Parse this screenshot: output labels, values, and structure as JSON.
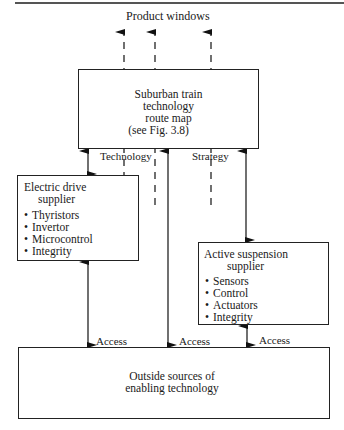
{
  "title_top": "Product windows",
  "route_map": {
    "lines": [
      "Suburban train",
      "technology",
      "route map",
      "(see Fig. 3.8)"
    ]
  },
  "flow_labels": {
    "technology": "Technology",
    "strategy": "Strategy",
    "access_left": "Access",
    "access_middle": "Access",
    "access_right": "Access"
  },
  "electric_drive": {
    "title_lines": [
      "Electric drive",
      "supplier"
    ],
    "items": [
      "Thyristors",
      "Invertor",
      "Microcontrol",
      "Integrity"
    ]
  },
  "active_suspension": {
    "title_lines": [
      "Active suspension",
      "supplier"
    ],
    "items": [
      "Sensors",
      "Control",
      "Actuators",
      "Integrity"
    ]
  },
  "outside_sources": {
    "lines": [
      "Outside sources of",
      "enabling technology"
    ]
  }
}
